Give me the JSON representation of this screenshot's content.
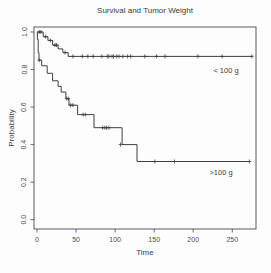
{
  "chart_data": {
    "type": "line",
    "subtype": "kaplan-meier-step",
    "title": "Survival and Tumor Weight",
    "xlabel": "Time",
    "ylabel": "Probability",
    "xlim": [
      0,
      280
    ],
    "ylim": [
      0.0,
      1.0
    ],
    "xticks": [
      0,
      50,
      100,
      150,
      200,
      250
    ],
    "ytick_labels": [
      "0.0",
      "0.2",
      "0.4",
      "0.6",
      "0.8",
      "1.0"
    ],
    "grid": false,
    "legend_position": "labels-inside-plot",
    "axis_color": "#4a4a4a",
    "line_color": "#3f3f3f",
    "series": [
      {
        "name": "< 100 g",
        "start": [
          0,
          1.0
        ],
        "drops": [
          [
            8,
            0.975
          ],
          [
            14,
            0.955
          ],
          [
            20,
            0.93
          ],
          [
            27,
            0.91
          ],
          [
            33,
            0.89
          ],
          [
            40,
            0.87
          ]
        ],
        "end_time": 275,
        "censor_marks": [
          [
            3,
            1.0
          ],
          [
            5,
            1.0
          ],
          [
            11,
            0.975
          ],
          [
            17,
            0.955
          ],
          [
            23,
            0.93
          ],
          [
            25,
            0.93
          ],
          [
            36,
            0.89
          ],
          [
            46,
            0.87
          ],
          [
            58,
            0.87
          ],
          [
            65,
            0.87
          ],
          [
            72,
            0.87
          ],
          [
            83,
            0.87
          ],
          [
            90,
            0.87
          ],
          [
            92,
            0.87
          ],
          [
            96,
            0.87
          ],
          [
            98,
            0.87
          ],
          [
            102,
            0.87
          ],
          [
            105,
            0.87
          ],
          [
            110,
            0.87
          ],
          [
            116,
            0.87
          ],
          [
            120,
            0.87
          ],
          [
            138,
            0.87
          ],
          [
            153,
            0.87
          ],
          [
            164,
            0.87
          ],
          [
            206,
            0.87
          ],
          [
            237,
            0.87
          ],
          [
            275,
            0.87
          ]
        ]
      },
      {
        "name": ">100 g",
        "start": [
          0,
          1.0
        ],
        "drops": [
          [
            0.5,
            0.96
          ],
          [
            1.5,
            0.89
          ],
          [
            2.5,
            0.85
          ],
          [
            6,
            0.82
          ],
          [
            13,
            0.78
          ],
          [
            20,
            0.74
          ],
          [
            27,
            0.71
          ],
          [
            31,
            0.68
          ],
          [
            37,
            0.645
          ],
          [
            41,
            0.61
          ],
          [
            52,
            0.56
          ],
          [
            73,
            0.49
          ],
          [
            109,
            0.4
          ],
          [
            128,
            0.31
          ]
        ],
        "end_time": 272,
        "censor_marks": [
          [
            3,
            0.85
          ],
          [
            38,
            0.645
          ],
          [
            40,
            0.645
          ],
          [
            43,
            0.61
          ],
          [
            46,
            0.61
          ],
          [
            59,
            0.56
          ],
          [
            62,
            0.56
          ],
          [
            84,
            0.49
          ],
          [
            87,
            0.49
          ],
          [
            89,
            0.49
          ],
          [
            92,
            0.49
          ],
          [
            107,
            0.4
          ],
          [
            151,
            0.31
          ],
          [
            176,
            0.31
          ],
          [
            272,
            0.31
          ]
        ]
      }
    ]
  }
}
